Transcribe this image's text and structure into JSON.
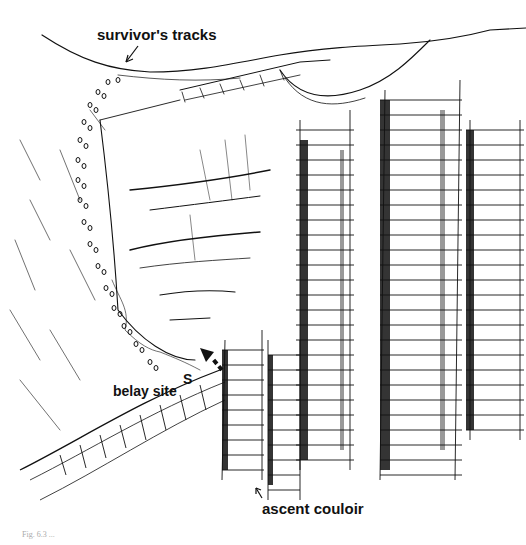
{
  "figure": {
    "labels": {
      "survivor_tracks": "survivor's tracks",
      "belay_site": "belay site",
      "belay_marker": "S",
      "ascent_couloir": "ascent couloir"
    },
    "caption": "Fig. 6.3  ...",
    "colors": {
      "ink": "#111111",
      "paper": "#ffffff"
    }
  }
}
